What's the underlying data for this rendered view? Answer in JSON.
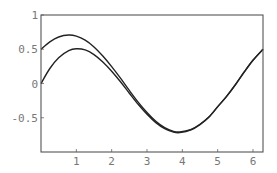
{
  "chart_data": {
    "type": "line",
    "title": "",
    "xlabel": "",
    "ylabel": "",
    "xlim": [
      0,
      6.2832
    ],
    "ylim": [
      -1,
      1
    ],
    "grid": false,
    "legend": null,
    "x_ticks": [
      1,
      2,
      3,
      4,
      5,
      6
    ],
    "x_tick_labels": [
      "1",
      "2",
      "3",
      "4",
      "5",
      "6"
    ],
    "y_ticks": [
      1,
      0.5,
      0,
      -0.5
    ],
    "y_tick_labels": [
      "1",
      "0.5",
      "0",
      "-0.5"
    ],
    "series": [
      {
        "name": "periodic solution",
        "x": [
          0,
          0.25,
          0.5,
          0.785,
          1.0,
          1.25,
          1.5,
          1.75,
          2.0,
          2.25,
          2.5,
          2.75,
          3.0,
          3.25,
          3.5,
          3.75,
          3.93,
          4.25,
          4.5,
          4.75,
          5.0,
          5.25,
          5.5,
          5.75,
          6.0,
          6.2832
        ],
        "y": [
          0.5,
          0.608,
          0.679,
          0.707,
          0.691,
          0.633,
          0.534,
          0.401,
          0.247,
          0.078,
          -0.101,
          -0.272,
          -0.424,
          -0.552,
          -0.644,
          -0.698,
          -0.707,
          -0.67,
          -0.595,
          -0.49,
          -0.338,
          -0.188,
          -0.018,
          0.168,
          0.34,
          0.5
        ],
        "color": "#222222"
      },
      {
        "name": "solution from y(0)=0",
        "x": [
          0,
          0.25,
          0.5,
          0.785,
          1.0,
          1.25,
          1.5,
          1.75,
          2.0,
          2.25,
          2.5,
          2.75,
          3.0,
          3.25,
          3.5,
          3.75,
          3.93,
          4.25,
          4.5,
          4.75,
          5.0,
          5.25,
          5.5,
          5.75,
          6.0,
          6.2832
        ],
        "y": [
          0.0,
          0.219,
          0.376,
          0.479,
          0.507,
          0.49,
          0.422,
          0.314,
          0.179,
          0.025,
          -0.142,
          -0.304,
          -0.449,
          -0.571,
          -0.659,
          -0.71,
          -0.717,
          -0.677,
          -0.601,
          -0.494,
          -0.341,
          -0.191,
          -0.02,
          0.166,
          0.339,
          0.499
        ],
        "color": "#222222"
      }
    ]
  }
}
